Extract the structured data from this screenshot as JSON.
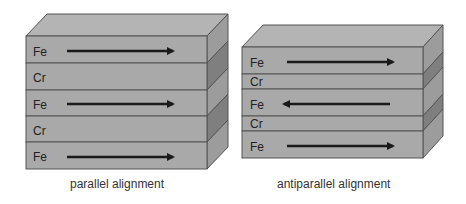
{
  "diagrams": [
    {
      "id": "parallel",
      "caption": "parallel alignment",
      "layers": [
        {
          "material": "Fe",
          "arrow": "right"
        },
        {
          "material": "Cr",
          "arrow": null
        },
        {
          "material": "Fe",
          "arrow": "right"
        },
        {
          "material": "Cr",
          "arrow": null
        },
        {
          "material": "Fe",
          "arrow": "right"
        }
      ]
    },
    {
      "id": "antiparallel",
      "caption": "antiparallel alignment",
      "layers": [
        {
          "material": "Fe",
          "arrow": "right"
        },
        {
          "material": "Cr",
          "arrow": null
        },
        {
          "material": "Fe",
          "arrow": "left"
        },
        {
          "material": "Cr",
          "arrow": null
        },
        {
          "material": "Fe",
          "arrow": "right"
        }
      ]
    }
  ],
  "colors": {
    "top_face": "#b4b4b4",
    "front_face": "#a9a9a9",
    "side_fe": "#9c9c9c",
    "side_cr": "#7f7f7f",
    "edge": "#555555",
    "arrow": "#1a1a1a"
  }
}
